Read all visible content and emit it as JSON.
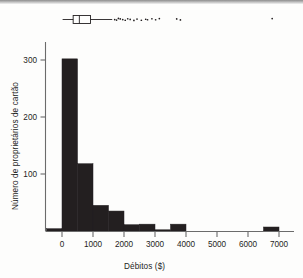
{
  "figure": {
    "background_color": "#fdfdfc",
    "ink_color": "#231f20",
    "axis_color": "#6b6b6b"
  },
  "axes": {
    "x_label": "Débitos ($)",
    "y_label": "Número de proprietários de cartão",
    "x_ticks": [
      "0",
      "1000",
      "2000",
      "3000",
      "4000",
      "5000",
      "6000",
      "7000"
    ],
    "y_ticks": [
      "100",
      "200",
      "300"
    ]
  },
  "chart_data": {
    "type": "histogram",
    "title": "",
    "xlabel": "Débitos ($)",
    "ylabel": "Número de proprietários de cartão",
    "xlim": [
      -500,
      7200
    ],
    "ylim": [
      0,
      330
    ],
    "xticks": [
      0,
      1000,
      2000,
      3000,
      4000,
      5000,
      6000,
      7000
    ],
    "yticks": [
      100,
      200,
      300
    ],
    "grid": false,
    "legend": "none",
    "bin_width": 500,
    "bin_edges": [
      -500,
      0,
      500,
      1000,
      1500,
      2000,
      2500,
      3000,
      3500,
      4000,
      4500,
      5000,
      5500,
      6000,
      6500,
      7000
    ],
    "counts": [
      4,
      302,
      118,
      45,
      35,
      11,
      12,
      1,
      12,
      0,
      0,
      0,
      0,
      0,
      7
    ],
    "bar_color": "#231f20",
    "boxplot": {
      "orientation": "horizontal",
      "whisker_low": 20,
      "q1": 360,
      "median": 560,
      "q3": 920,
      "whisker_high": 1620,
      "outliers": [
        1700,
        1760,
        1820,
        1880,
        1960,
        2040,
        2120,
        2200,
        2320,
        2420,
        2560,
        2700,
        2760,
        2900,
        3020,
        3140,
        3700,
        3820,
        6780
      ]
    }
  }
}
